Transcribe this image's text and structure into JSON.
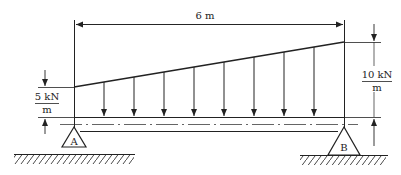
{
  "diagram": {
    "type": "simply-supported beam with linearly varying distributed load",
    "span_label": "6 m",
    "load_left": {
      "value": "5 kN",
      "unit": "m"
    },
    "load_right": {
      "value": "10 kN",
      "unit": "m"
    },
    "support_left": {
      "label": "A"
    },
    "support_right": {
      "label": "B"
    },
    "line_color": "#222222",
    "background": "#ffffff",
    "arrow_x": [
      104,
      134,
      164,
      194,
      224,
      254,
      284,
      314
    ]
  }
}
